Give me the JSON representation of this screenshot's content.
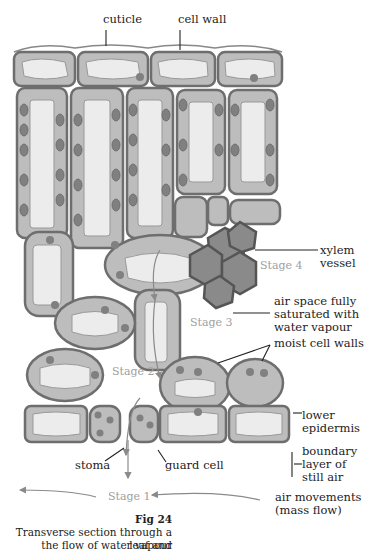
{
  "labels": {
    "cuticle": "cuticle",
    "cell_wall": "cell wall",
    "xylem_vessel_1": "xylem",
    "xylem_vessel_2": "vessel",
    "air_space_1": "air space fully",
    "air_space_2": "saturated with",
    "air_space_3": "water vapour",
    "moist_cell_walls": "moist cell walls",
    "lower_epidermis_1": "lower",
    "lower_epidermis_2": "epidermis",
    "boundary_1": "boundary",
    "boundary_2": "layer of",
    "boundary_3": "still air",
    "stoma": "stoma",
    "guard_cell": "guard cell",
    "air_movements_1": "air movements",
    "air_movements_2": "(mass flow)"
  },
  "stages": {
    "stage1": "Stage 1",
    "stage2": "Stage 2",
    "stage3": "Stage 3",
    "stage4": "Stage 4"
  },
  "caption": {
    "fig_number": "Fig 24",
    "line1": "Transverse section through a leaf and",
    "line2": "the flow of water vapour"
  },
  "colors": {
    "cell_fill": "#bdbdbd",
    "cell_border": "#6e6e6e",
    "vacuole": "#ececec",
    "chloroplast": "#808080",
    "xylem": "#8a8a8a",
    "stage_text": "#a0a0a0"
  }
}
